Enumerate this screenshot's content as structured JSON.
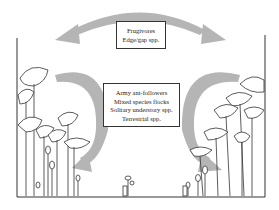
{
  "diagram": {
    "top_box": {
      "lines": [
        "Frugivores",
        "Edge/gap spp."
      ]
    },
    "lower_box": {
      "lines": [
        "Army ant-followers",
        "Mixed species flocks",
        "Solitary understory spp.",
        "Terrestrial spp."
      ]
    },
    "colors": {
      "arrow": "#b3b3b3",
      "line": "#333333"
    }
  }
}
